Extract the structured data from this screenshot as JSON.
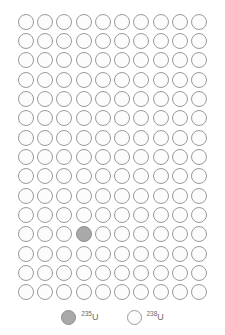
{
  "figure": {
    "name": "uranium-isotope-abundance-dot-grid",
    "grid": {
      "columns": 10,
      "rows": 15,
      "total_dots": 150,
      "u235_count": 1,
      "u238_count": 149,
      "u235_positions": [
        {
          "row": 12,
          "col": 4
        }
      ]
    },
    "colors": {
      "u235_fill": "#a9a9a9",
      "u235_stroke": "#8d8d8d",
      "u238_fill": "#fcfcfc",
      "u238_stroke": "#9a9a9a",
      "background": "#ffffff",
      "label_text": "#6b6b6b"
    }
  },
  "legend": {
    "position": "bottom-center",
    "items": [
      {
        "id": "u235",
        "mass_number": "235",
        "element": "U",
        "label": "235U",
        "style": "filled"
      },
      {
        "id": "u238",
        "mass_number": "238",
        "element": "U",
        "label": "238U",
        "style": "outlined"
      }
    ]
  },
  "chart_data": {
    "type": "table",
    "title": "",
    "categories": [
      "235U",
      "238U"
    ],
    "values": [
      1,
      149
    ],
    "xlabel": "",
    "ylabel": "",
    "unit": "dots (1 dot = 1 part in 150)"
  }
}
